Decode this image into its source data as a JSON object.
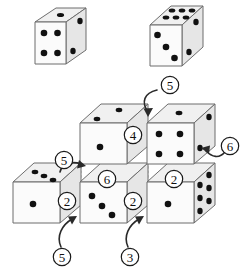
{
  "figure": {
    "width": 242,
    "height": 272,
    "background_color": "#ffffff",
    "pip_color": "#111111",
    "outline_color": "#6d6d6d",
    "hidden_edge_color": "#9a9a9a",
    "callout_color": "#111111"
  },
  "reference_dice": [
    {
      "id": "die-left",
      "label": "left reference die",
      "faces": {
        "top": 1,
        "front": 4,
        "right": 2
      }
    },
    {
      "id": "die-right",
      "label": "right reference die",
      "faces": {
        "top": 6,
        "front": 3,
        "right": 2
      }
    }
  ],
  "cube_stack": {
    "label": "stack of four cubes",
    "cubes": [
      {
        "id": "cube-bottom-left",
        "position": "bottom-left",
        "faces": {
          "top": 3,
          "front": 1,
          "right": null
        }
      },
      {
        "id": "cube-bottom-middle",
        "position": "bottom-middle",
        "faces": {
          "top": null,
          "front": 3,
          "right": null
        }
      },
      {
        "id": "cube-bottom-right",
        "position": "bottom-right",
        "faces": {
          "top": null,
          "front": 1,
          "right": 6
        }
      },
      {
        "id": "cube-upper-left",
        "position": "upper-left",
        "faces": {
          "top": 2,
          "front": 1,
          "right": null
        }
      },
      {
        "id": "cube-upper-right",
        "position": "upper-right",
        "faces": {
          "top": 1,
          "front": 4,
          "right": 2
        }
      }
    ]
  },
  "callouts": [
    {
      "id": "callout-5-top",
      "value": "5",
      "has_arrow": true,
      "points_to": "cube-upper-right top face"
    },
    {
      "id": "callout-4-mid",
      "value": "4",
      "has_arrow": false,
      "points_to": "cube-upper-left right face"
    },
    {
      "id": "callout-6-right",
      "value": "6",
      "has_arrow": true,
      "points_to": "cube-upper-right right face"
    },
    {
      "id": "callout-5-left",
      "value": "5",
      "has_arrow": true,
      "points_to": "cube-upper-left left/hidden face"
    },
    {
      "id": "callout-6-center",
      "value": "6",
      "has_arrow": false,
      "points_to": "cube-bottom-middle top face"
    },
    {
      "id": "callout-2-left",
      "value": "2",
      "has_arrow": false,
      "points_to": "cube-bottom-left right face"
    },
    {
      "id": "callout-2-middle",
      "value": "2",
      "has_arrow": false,
      "points_to": "cube-bottom-middle right face"
    },
    {
      "id": "callout-2-right",
      "value": "2",
      "has_arrow": false,
      "points_to": "cube-bottom-right top face"
    },
    {
      "id": "callout-5-bottom",
      "value": "5",
      "has_arrow": true,
      "points_to": "cube-bottom-middle left face"
    },
    {
      "id": "callout-3-bottom",
      "value": "3",
      "has_arrow": true,
      "points_to": "cube-bottom-right left face"
    }
  ]
}
